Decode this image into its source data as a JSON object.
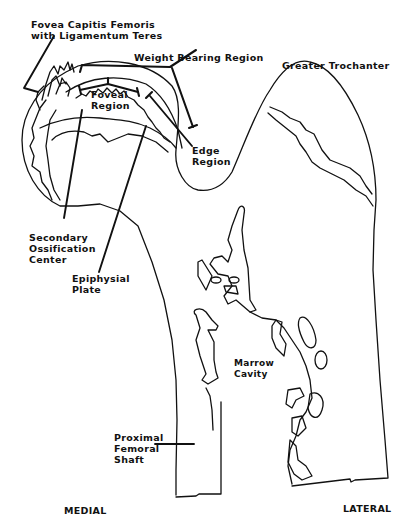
{
  "figure": {
    "type": "anatomical line drawing"
  },
  "labels": {
    "fovea": [
      "Fovea Capitis Femoris",
      "with Ligamentum Teres"
    ],
    "weight_bearing": [
      "Weight Bearing Region"
    ],
    "greater_trochanter": [
      "Greater Trochanter"
    ],
    "foveal_region": [
      "Foveal",
      "Region"
    ],
    "edge_region": [
      "Edge",
      "Region"
    ],
    "secondary_ossification": [
      "Secondary",
      "Ossification",
      "Center"
    ],
    "epiphysial_plate": [
      "Epiphysial",
      "Plate"
    ],
    "marrow_cavity": [
      "Marrow",
      "Cavity"
    ],
    "proximal_shaft": [
      "Proximal",
      "Femoral",
      "Shaft"
    ]
  },
  "orientation": {
    "left": "MEDIAL",
    "right": "LATERAL"
  }
}
